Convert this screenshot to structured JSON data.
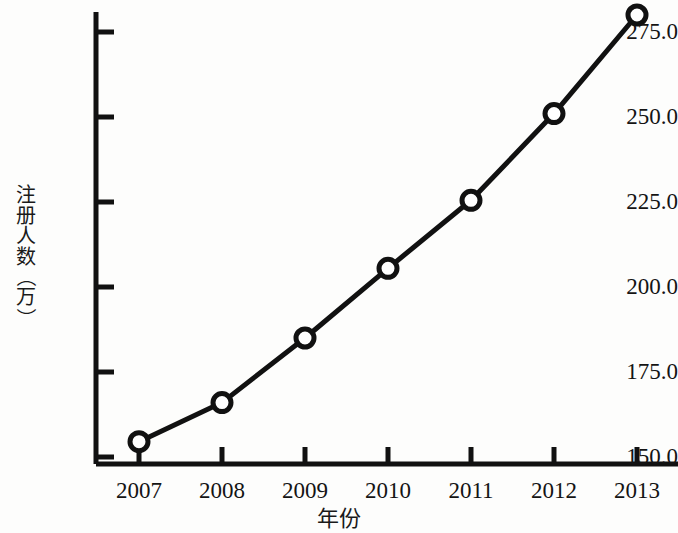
{
  "chart_data": {
    "type": "line",
    "title": "",
    "xlabel": "年份",
    "ylabel": "注册人数（万）",
    "categories": [
      "2007",
      "2008",
      "2009",
      "2010",
      "2011",
      "2012",
      "2013"
    ],
    "values": [
      154.5,
      166.0,
      185.0,
      205.5,
      225.5,
      251.0,
      280.0
    ],
    "series": [
      {
        "name": "注册人数",
        "values": [
          154.5,
          166.0,
          185.0,
          205.5,
          225.5,
          251.0,
          280.0
        ]
      }
    ],
    "ylim": [
      150.0,
      281.0
    ],
    "ytick_labels": [
      "150.0",
      "175.0",
      "200.0",
      "225.0",
      "250.0",
      "275.0"
    ],
    "ytick_values": [
      150.0,
      175.0,
      200.0,
      225.0,
      250.0,
      275.0
    ],
    "xtick_labels": [
      "2007",
      "2008",
      "2009",
      "2010",
      "2011",
      "2012",
      "2013"
    ],
    "grid": false,
    "legend": "none",
    "marker": "circle-open",
    "line_color": "#111111",
    "marker_color": "#111111",
    "background_color": "#fdfdfc"
  },
  "ylabel_chars": [
    "注",
    "册",
    "人",
    "数",
    "（",
    "万",
    "）"
  ]
}
